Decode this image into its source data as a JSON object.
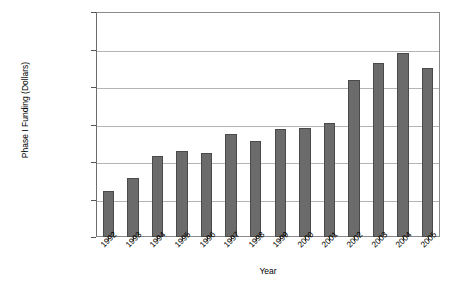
{
  "chart_data": {
    "type": "bar",
    "title": "",
    "xlabel": "Year",
    "ylabel": "Phase I Funding (Dollars)",
    "categories": [
      "1992",
      "1993",
      "1994",
      "1995",
      "1996",
      "1997",
      "1998",
      "1999",
      "2000",
      "2001",
      "2002",
      "2003",
      "2004",
      "2005"
    ],
    "values": [
      123000000,
      157000000,
      217000000,
      230000000,
      224000000,
      276000000,
      256000000,
      288000000,
      290000000,
      304000000,
      420000000,
      464000000,
      491000000,
      450000000
    ],
    "ylim": [
      0,
      600000000
    ],
    "ytick_values": [
      0,
      100000000,
      200000000,
      300000000,
      400000000,
      500000000,
      600000000
    ],
    "ytick_labels": [
      "0",
      "100,000,000",
      "200,000,000",
      "300,000,000",
      "400,000,000",
      "500,000,000",
      "600,000,000"
    ],
    "grid": true,
    "legend": false,
    "legend_position": "none",
    "bar_color": "#6b6b6b",
    "bar_border_color": "#4a4a4a",
    "gridline_color": "#b4b4b4",
    "frame_color": "#8a8a8a"
  }
}
